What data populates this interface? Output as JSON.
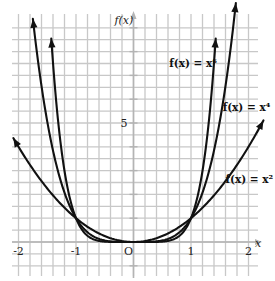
{
  "chart_data": {
    "type": "line",
    "title": "",
    "xlabel": "x",
    "ylabel": "f(x)",
    "xlim": [
      -2.05,
      2.05
    ],
    "ylim": [
      -0.7,
      9.5
    ],
    "grid": true,
    "x_grid_step": 0.2,
    "y_grid_step": 0.5,
    "x_ticks": [
      {
        "value": -2,
        "label": "-2"
      },
      {
        "value": -1,
        "label": "-1"
      },
      {
        "value": 0,
        "label": "O"
      },
      {
        "value": 1,
        "label": "1"
      },
      {
        "value": 2,
        "label": "2"
      }
    ],
    "y_ticks": [
      {
        "value": 5,
        "label": "5"
      }
    ],
    "y_tick_marks": [
      1,
      2,
      3,
      4,
      5,
      6,
      7,
      8,
      9
    ],
    "series": [
      {
        "name": "f(x) = x²",
        "exponent": 2,
        "x_range": [
          -2.09,
          2.26
        ],
        "label": "f(x) = x²",
        "label_anchor": {
          "x": 1.6,
          "y": 2.5
        }
      },
      {
        "name": "f(x) = x⁴",
        "exponent": 4,
        "x_range": [
          -1.75,
          1.78
        ],
        "label": "f(x) = x⁴",
        "label_anchor": {
          "x": 1.55,
          "y": 5.5
        }
      },
      {
        "name": "f(x) = x⁶",
        "exponent": 6,
        "x_range": [
          -1.43,
          1.43
        ],
        "label": "f(x) = x⁶",
        "label_anchor": {
          "x": 0.62,
          "y": 7.35
        }
      }
    ],
    "intersections": [
      {
        "x": -1,
        "y": 1
      },
      {
        "x": 0,
        "y": 0
      },
      {
        "x": 1,
        "y": 1
      }
    ]
  },
  "labels": {
    "y_axis_title": "f(x)",
    "x_axis_title": "x"
  }
}
